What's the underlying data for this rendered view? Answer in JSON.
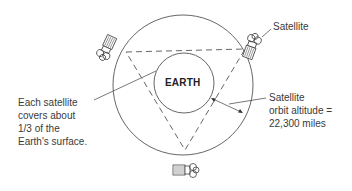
{
  "diagram": {
    "type": "geostationary-satellite-coverage",
    "earth_label": "EARTH",
    "labels": {
      "satellite": "Satellite",
      "coverage": [
        "Each satellite",
        "covers about",
        "1/3 of the",
        "Earth's surface."
      ],
      "altitude": [
        "Satellite",
        "orbit altitude =",
        "22,300 miles"
      ]
    },
    "satellites": [
      {
        "position": "upper-left",
        "icon": "satellite-icon"
      },
      {
        "position": "upper-right",
        "icon": "satellite-icon"
      },
      {
        "position": "bottom",
        "icon": "satellite-icon"
      }
    ],
    "colors": {
      "line": "#555555",
      "text": "#3a3a3a",
      "background": "#ffffff"
    }
  }
}
